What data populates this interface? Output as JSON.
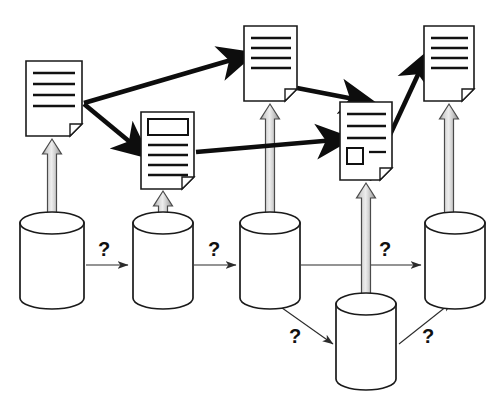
{
  "diagram": {
    "canvas": {
      "width": 501,
      "height": 402,
      "background": "#ffffff"
    },
    "colors": {
      "outline": "#1a1a1a",
      "thick_arrow": "#0d0d0d",
      "thin_arrow": "#2b2b2b",
      "block_arrow_light": "#e8e8e8",
      "block_arrow_mid": "#bdbdbd",
      "block_arrow_dark": "#8f8f8f",
      "block_arrow_stroke": "#4a4a4a",
      "question_mark": "#111111",
      "paper_fill": "#ffffff"
    },
    "documents": [
      {
        "id": "doc-1",
        "name": "document-top-left",
        "x": 26,
        "y": 61,
        "width": 56,
        "height": 75,
        "fold": 12,
        "lines": 4,
        "has_box": false,
        "has_square": false
      },
      {
        "id": "doc-2",
        "name": "document-second",
        "x": 141,
        "y": 112,
        "width": 53,
        "height": 77,
        "fold": 12,
        "lines": 4,
        "has_box": true,
        "has_square": false
      },
      {
        "id": "doc-3",
        "name": "document-third",
        "x": 244,
        "y": 26,
        "width": 53,
        "height": 75,
        "fold": 12,
        "lines": 4,
        "has_box": false,
        "has_square": false
      },
      {
        "id": "doc-4",
        "name": "document-fourth",
        "x": 340,
        "y": 102,
        "width": 52,
        "height": 78,
        "fold": 12,
        "lines": 3,
        "has_box": false,
        "has_square": true
      },
      {
        "id": "doc-5",
        "name": "document-top-right",
        "x": 424,
        "y": 26,
        "width": 50,
        "height": 75,
        "fold": 12,
        "lines": 4,
        "has_box": false,
        "has_square": false
      }
    ],
    "databases": [
      {
        "id": "db-1",
        "name": "database-cylinder-1",
        "cx": 52,
        "top": 223,
        "width": 68,
        "height": 75,
        "ellipse_ry": 11
      },
      {
        "id": "db-2",
        "name": "database-cylinder-2",
        "cx": 163,
        "top": 223,
        "width": 60,
        "height": 75,
        "ellipse_ry": 11
      },
      {
        "id": "db-3",
        "name": "database-cylinder-3",
        "cx": 270,
        "top": 223,
        "width": 60,
        "height": 75,
        "ellipse_ry": 11
      },
      {
        "id": "db-4",
        "name": "database-cylinder-4",
        "cx": 366,
        "top": 304,
        "width": 60,
        "height": 75,
        "ellipse_ry": 11
      },
      {
        "id": "db-5",
        "name": "database-cylinder-5",
        "cx": 455,
        "top": 223,
        "width": 60,
        "height": 75,
        "ellipse_ry": 11
      }
    ],
    "block_arrows": [
      {
        "id": "ba-1",
        "name": "block-arrow-db1-to-doc1",
        "from": "db-1",
        "to": "doc-1",
        "x": 52,
        "y_top": 139,
        "y_bottom": 226,
        "shaft_width": 9,
        "head_width": 19,
        "head_height": 15
      },
      {
        "id": "ba-2",
        "name": "block-arrow-db2-to-doc2",
        "from": "db-2",
        "to": "doc-2",
        "x": 163,
        "y_top": 191,
        "y_bottom": 226,
        "shaft_width": 9,
        "head_width": 19,
        "head_height": 15
      },
      {
        "id": "ba-3",
        "name": "block-arrow-db3-to-doc3",
        "from": "db-3",
        "to": "doc-3",
        "x": 270,
        "y_top": 104,
        "y_bottom": 226,
        "shaft_width": 9,
        "head_width": 19,
        "head_height": 15
      },
      {
        "id": "ba-4",
        "name": "block-arrow-db4-to-doc4",
        "from": "db-4",
        "to": "doc-4",
        "x": 366,
        "y_top": 183,
        "y_bottom": 307,
        "shaft_width": 9,
        "head_width": 19,
        "head_height": 15
      },
      {
        "id": "ba-5",
        "name": "block-arrow-db5-to-doc5",
        "from": "db-5",
        "to": "doc-5",
        "x": 449,
        "y_top": 104,
        "y_bottom": 226,
        "shaft_width": 9,
        "head_width": 19,
        "head_height": 15
      }
    ],
    "thick_arrows": [
      {
        "id": "ta-1",
        "name": "thick-arrow-doc1-to-doc3",
        "from": "doc-1",
        "to": "doc-3"
      },
      {
        "id": "ta-2",
        "name": "thick-arrow-doc1-to-doc2",
        "from": "doc-1",
        "to": "doc-2"
      },
      {
        "id": "ta-3",
        "name": "thick-arrow-doc3-to-doc4",
        "from": "doc-3",
        "to": "doc-4"
      },
      {
        "id": "ta-4",
        "name": "thick-arrow-doc2-to-doc4",
        "from": "doc-2",
        "to": "doc-4"
      },
      {
        "id": "ta-5",
        "name": "thick-arrow-doc4-to-doc5",
        "from": "doc-4",
        "to": "doc-5"
      }
    ],
    "thin_arrows": [
      {
        "id": "tna-1",
        "name": "thin-arrow-db1-to-db2",
        "from": "db-1",
        "to": "db-2"
      },
      {
        "id": "tna-2",
        "name": "thin-arrow-db2-to-db3",
        "from": "db-2",
        "to": "db-3"
      },
      {
        "id": "tna-3",
        "name": "thin-arrow-db3-to-db5",
        "from": "db-3",
        "to": "db-5"
      },
      {
        "id": "tna-4",
        "name": "thin-arrow-db3-to-db4",
        "from": "db-3",
        "to": "db-4"
      },
      {
        "id": "tna-5",
        "name": "thin-arrow-db4-to-db5",
        "from": "db-4",
        "to": "db-5"
      }
    ],
    "question_marks": [
      {
        "id": "q-1",
        "name": "question-mark-1",
        "label": "?",
        "x": 104,
        "y": 256,
        "edge": "tna-1"
      },
      {
        "id": "q-2",
        "name": "question-mark-2",
        "label": "?",
        "x": 214,
        "y": 256,
        "edge": "tna-2"
      },
      {
        "id": "q-3",
        "name": "question-mark-3",
        "label": "?",
        "x": 385,
        "y": 256,
        "edge": "tna-3"
      },
      {
        "id": "q-4",
        "name": "question-mark-4",
        "label": "?",
        "x": 295,
        "y": 343,
        "edge": "tna-4"
      },
      {
        "id": "q-5",
        "name": "question-mark-5",
        "label": "?",
        "x": 428,
        "y": 343,
        "edge": "tna-5"
      }
    ]
  }
}
